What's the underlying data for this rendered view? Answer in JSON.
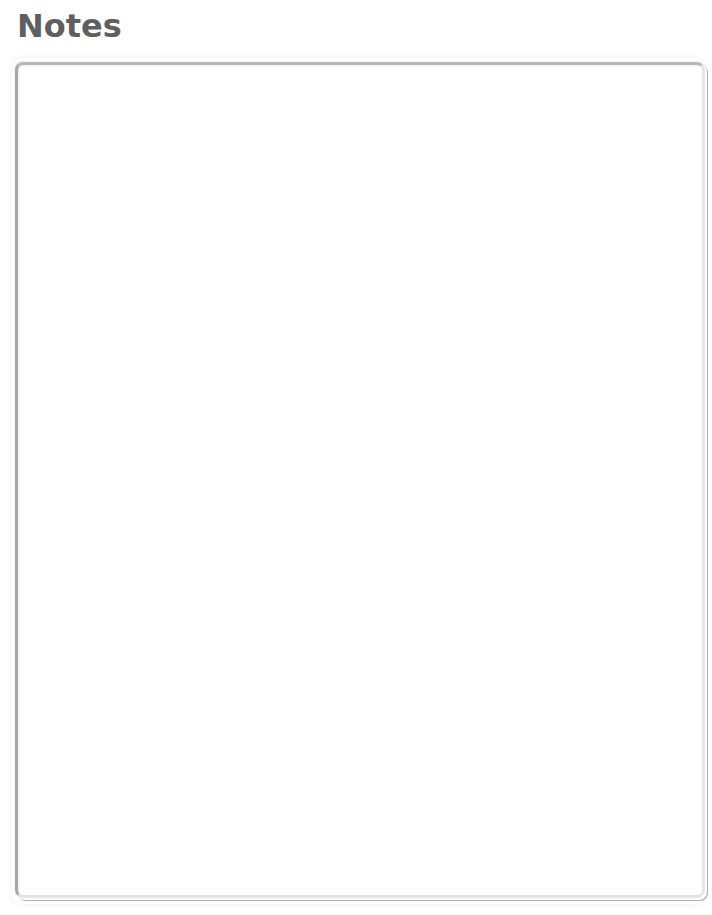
{
  "header": {
    "title": "Notes"
  },
  "notes": {
    "value": "",
    "placeholder": ""
  }
}
